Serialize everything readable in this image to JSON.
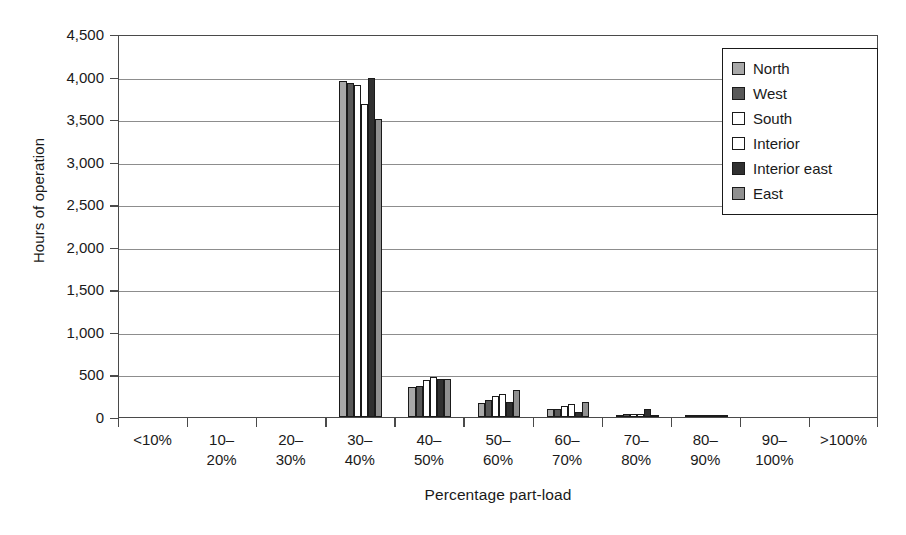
{
  "chart_data": {
    "type": "bar",
    "title": "",
    "xlabel": "Percentage part-load",
    "ylabel": "Hours of operation",
    "ylim": [
      0,
      4500
    ],
    "ytick_step": 500,
    "ytick_labels": [
      "0",
      "500",
      "1,000",
      "1,500",
      "2,000",
      "2,500",
      "3,000",
      "3,500",
      "4,000",
      "4,500"
    ],
    "ytick_values": [
      0,
      500,
      1000,
      1500,
      2000,
      2500,
      3000,
      3500,
      4000,
      4500
    ],
    "grid": true,
    "legend_position": "top-right",
    "categories": [
      "<10%",
      "10–\n20%",
      "20–\n30%",
      "30–\n40%",
      "40–\n50%",
      "50–\n60%",
      "60–\n70%",
      "70–\n80%",
      "80–\n90%",
      "90–\n100%",
      ">100%"
    ],
    "category_lines": [
      [
        "<10%",
        ""
      ],
      [
        "10–",
        "20%"
      ],
      [
        "20–",
        "30%"
      ],
      [
        "30–",
        "40%"
      ],
      [
        "40–",
        "50%"
      ],
      [
        "50–",
        "60%"
      ],
      [
        "60–",
        "70%"
      ],
      [
        "70–",
        "80%"
      ],
      [
        "80–",
        "90%"
      ],
      [
        "90–",
        "100%"
      ],
      [
        ">100%",
        ""
      ]
    ],
    "series": [
      {
        "name": "North",
        "color": "#a8a8a8",
        "values": [
          0,
          0,
          0,
          3950,
          350,
          170,
          90,
          20,
          10,
          0,
          0
        ]
      },
      {
        "name": "West",
        "color": "#585858",
        "values": [
          0,
          0,
          0,
          3930,
          370,
          200,
          100,
          40,
          25,
          0,
          0
        ]
      },
      {
        "name": "South",
        "color": "#ffffff",
        "values": [
          0,
          0,
          0,
          3900,
          440,
          250,
          130,
          30,
          10,
          0,
          0
        ]
      },
      {
        "name": "Interior",
        "color": "#ffffff",
        "values": [
          0,
          0,
          0,
          3680,
          470,
          270,
          150,
          30,
          10,
          0,
          0
        ]
      },
      {
        "name": "Interior east",
        "color": "#303030",
        "values": [
          0,
          0,
          0,
          3980,
          450,
          180,
          60,
          90,
          15,
          0,
          0
        ]
      },
      {
        "name": "East",
        "color": "#909090",
        "values": [
          0,
          0,
          0,
          3500,
          450,
          320,
          180,
          20,
          10,
          0,
          0
        ]
      }
    ]
  },
  "legend": {
    "items": [
      {
        "label": "North",
        "swatch": "#a8a8a8"
      },
      {
        "label": "West",
        "swatch": "#585858"
      },
      {
        "label": "South",
        "swatch": "#ffffff"
      },
      {
        "label": "Interior",
        "swatch": "#ffffff"
      },
      {
        "label": "Interior east",
        "swatch": "#303030"
      },
      {
        "label": "East",
        "swatch": "#909090"
      }
    ]
  }
}
